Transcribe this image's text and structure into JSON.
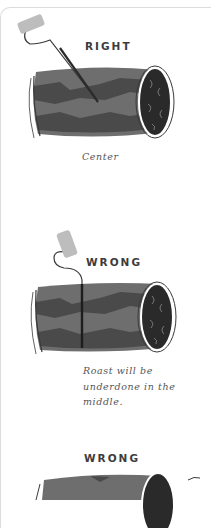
{
  "panels": [
    {
      "label": "RIGHT",
      "caption": "Center",
      "thermometer_placement": "angled-into-center"
    },
    {
      "label": "WRONG",
      "caption_lines": [
        "Roast will be",
        "underdone in the",
        "middle."
      ],
      "thermometer_placement": "straight-down-off-center"
    },
    {
      "label": "WRONG",
      "thermometer_placement": "partially-visible"
    }
  ],
  "colors": {
    "roast_light": "#6e6e6e",
    "roast_dark": "#4a4a4a",
    "roast_end": "#2a2a2a",
    "handle": "#bdbdbd",
    "probe": "#2b2b2b",
    "label_text": "#3c3c3c"
  }
}
